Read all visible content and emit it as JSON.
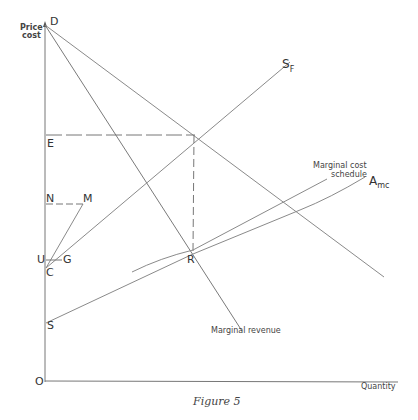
{
  "figure": {
    "caption": "Figure 5",
    "axes": {
      "y_label_line1": "Price",
      "y_label_line2": "cost",
      "x_label": "Quantity",
      "origin": "O"
    },
    "points": {
      "D": "D",
      "E": "E",
      "N": "N",
      "M": "M",
      "U": "U",
      "G": "G",
      "C": "C",
      "S": "S",
      "R": "R"
    },
    "curves": {
      "sf_main": "S",
      "sf_sub": "F",
      "amc_main": "A",
      "amc_sub": "mc",
      "mc_line1": "Marginal cost",
      "mc_line2": "schedule",
      "mr": "Marginal revenue"
    },
    "colors": {
      "line": "#8a8a8a",
      "axis": "#777777",
      "text": "#333333"
    }
  }
}
